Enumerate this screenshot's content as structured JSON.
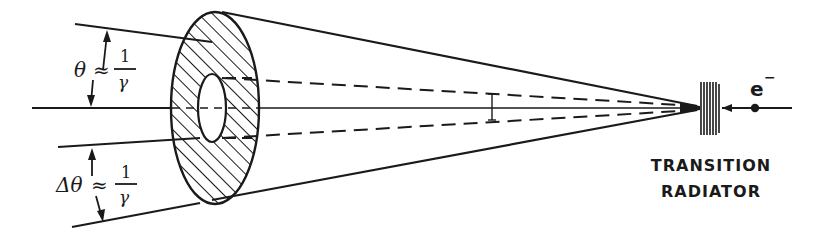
{
  "diagram": {
    "type": "transition-radiation-cone",
    "labels": {
      "theta": {
        "symbol": "θ",
        "approx": "≈",
        "numerator": "1",
        "denominator": "γ"
      },
      "delta_theta": {
        "symbol": "Δθ",
        "approx": "≈",
        "numerator": "1",
        "denominator": "γ"
      },
      "electron": {
        "symbol": "e",
        "superscript": "−"
      },
      "radiator": {
        "line1": "TRANSITION",
        "line2": "RADIATOR"
      }
    },
    "colors": {
      "ink": "#1a1a1a",
      "background": "#ffffff"
    }
  }
}
